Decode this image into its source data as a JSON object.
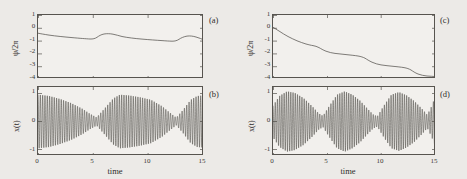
{
  "figure": {
    "background_color": "#eceae7",
    "frame_color": "#57544f",
    "curve_color": "#4a4744"
  },
  "panels": [
    {
      "id": "a",
      "tag": "(a)",
      "ylabel": "ψ/2π",
      "xlabel": "",
      "yticks": [
        "1",
        "0",
        "-1",
        "-2",
        "-3",
        "-4"
      ],
      "xticks": [
        "",
        "",
        "",
        ""
      ],
      "ylim": [
        -4,
        1
      ],
      "xlim": [
        0,
        15
      ]
    },
    {
      "id": "b",
      "tag": "(b)",
      "ylabel": "x(t)",
      "xlabel": "time",
      "yticks": [
        "1",
        "0",
        "-1"
      ],
      "xticks": [
        "0",
        "5",
        "10",
        "15"
      ],
      "ylim": [
        -1.35,
        1.35
      ],
      "xlim": [
        0,
        15
      ]
    },
    {
      "id": "c",
      "tag": "(c)",
      "ylabel": "ψ/2π",
      "xlabel": "",
      "yticks": [
        "1",
        "0",
        "-1",
        "-2",
        "-3",
        "-4"
      ],
      "xticks": [
        "",
        "",
        "",
        ""
      ],
      "ylim": [
        -4,
        1
      ],
      "xlim": [
        0,
        15
      ]
    },
    {
      "id": "d",
      "tag": "(d)",
      "ylabel": "x(t)",
      "xlabel": "time",
      "yticks": [
        "1",
        "0",
        "-1"
      ],
      "xticks": [
        "0",
        "5",
        "10",
        "15"
      ],
      "ylim": [
        -1.35,
        1.35
      ],
      "xlim": [
        0,
        15
      ]
    }
  ],
  "chart_data": [
    {
      "type": "line",
      "panel": "a",
      "title": "(a)",
      "xlabel": "time",
      "ylabel": "ψ/2π",
      "xlim": [
        0,
        15
      ],
      "ylim": [
        -4,
        1
      ],
      "xticks": [
        0,
        5,
        10,
        15
      ],
      "yticks": [
        1,
        0,
        -1,
        -2,
        -3,
        -4
      ],
      "grid": false,
      "legend": "none",
      "series": [
        {
          "name": "phase",
          "x": [
            0,
            0.5,
            1.0,
            1.5,
            2.0,
            2.5,
            3.0,
            3.5,
            4.0,
            4.5,
            5.0,
            5.3,
            5.6,
            6.0,
            6.4,
            6.8,
            7.2,
            7.6,
            8.0,
            8.5,
            9.0,
            9.5,
            10.0,
            10.5,
            11.0,
            11.5,
            12.0,
            12.5,
            12.9,
            13.3,
            13.7,
            14.1,
            14.5,
            15.0
          ],
          "y": [
            -0.42,
            -0.45,
            -0.47,
            -0.49,
            -0.51,
            -0.53,
            -0.55,
            -0.57,
            -0.58,
            -0.59,
            -0.6,
            -0.58,
            -0.5,
            -0.44,
            -0.42,
            -0.44,
            -0.48,
            -0.52,
            -0.55,
            -0.57,
            -0.59,
            -0.6,
            -0.62,
            -0.63,
            -0.64,
            -0.65,
            -0.66,
            -0.64,
            -0.56,
            -0.48,
            -0.46,
            -0.49,
            -0.54,
            -0.6
          ]
        }
      ]
    },
    {
      "type": "line",
      "panel": "b",
      "title": "(b)",
      "xlabel": "time",
      "ylabel": "x(t)",
      "xlim": [
        0,
        15
      ],
      "ylim": [
        -1.35,
        1.35
      ],
      "xticks": [
        0,
        5,
        10,
        15
      ],
      "yticks": [
        1,
        0,
        -1
      ],
      "grid": false,
      "legend": "none",
      "description": "Amplitude-modulated (beating) oscillation, carrier period approx 0.21 time units, beat nodes near t=5.3 and t=12.5",
      "carrier_period": 0.21,
      "envelope": {
        "x": [
          0,
          1.0,
          2.0,
          3.0,
          4.0,
          4.7,
          5.3,
          6.0,
          6.8,
          7.4,
          8.2,
          9.2,
          10.2,
          11.2,
          11.9,
          12.5,
          13.1,
          13.8,
          14.4,
          15.0
        ],
        "amplitude": [
          1.05,
          1.0,
          0.88,
          0.72,
          0.5,
          0.3,
          0.16,
          0.5,
          0.9,
          1.05,
          1.02,
          0.95,
          0.85,
          0.6,
          0.35,
          0.15,
          0.45,
          0.85,
          1.0,
          1.02
        ]
      }
    },
    {
      "type": "line",
      "panel": "c",
      "title": "(c)",
      "xlabel": "time",
      "ylabel": "ψ/2π",
      "xlim": [
        0,
        15
      ],
      "ylim": [
        -4,
        1
      ],
      "xticks": [
        0,
        5,
        10,
        15
      ],
      "yticks": [
        1,
        0,
        -1,
        -2,
        -3,
        -4
      ],
      "grid": false,
      "legend": "none",
      "description": "Monotonically decreasing phase with staircase-like plateaus (phase slips)",
      "series": [
        {
          "name": "phase",
          "x": [
            0,
            0.4,
            0.8,
            1.2,
            1.7,
            2.2,
            2.7,
            3.2,
            3.6,
            4.0,
            4.4,
            4.8,
            5.2,
            5.7,
            6.3,
            6.9,
            7.5,
            8.1,
            8.6,
            9.0,
            9.4,
            9.8,
            10.3,
            10.9,
            11.5,
            12.1,
            12.7,
            13.2,
            13.6,
            14.0,
            14.4,
            14.8,
            15.0
          ],
          "y": [
            0.05,
            -0.18,
            -0.38,
            -0.55,
            -0.72,
            -0.88,
            -1.0,
            -1.1,
            -1.25,
            -1.42,
            -1.55,
            -1.62,
            -1.68,
            -1.74,
            -1.8,
            -1.86,
            -1.92,
            -2.0,
            -2.12,
            -2.3,
            -2.45,
            -2.55,
            -2.62,
            -2.68,
            -2.74,
            -2.8,
            -2.88,
            -3.0,
            -3.15,
            -3.3,
            -3.42,
            -3.5,
            -3.55
          ]
        }
      ]
    },
    {
      "type": "line",
      "panel": "d",
      "title": "(d)",
      "xlabel": "time",
      "ylabel": "x(t)",
      "xlim": [
        0,
        15
      ],
      "ylim": [
        -1.35,
        1.35
      ],
      "xticks": [
        0,
        5,
        10,
        15
      ],
      "yticks": [
        1,
        0,
        -1
      ],
      "grid": false,
      "legend": "none",
      "description": "Amplitude-modulated (beating) oscillation with three beat cycles, nodes near t=4.6, t=9.6 and t=14.2",
      "carrier_period": 0.205,
      "envelope": {
        "x": [
          0,
          0.6,
          1.3,
          2.0,
          2.8,
          3.6,
          4.2,
          4.6,
          5.2,
          5.9,
          6.6,
          7.3,
          8.0,
          8.7,
          9.2,
          9.6,
          10.2,
          10.9,
          11.6,
          12.3,
          13.0,
          13.7,
          14.2,
          14.6,
          15.0
        ],
        "amplitude": [
          0.62,
          1.0,
          1.18,
          1.12,
          0.92,
          0.6,
          0.32,
          0.22,
          0.62,
          1.05,
          1.18,
          1.05,
          0.82,
          0.5,
          0.28,
          0.2,
          0.62,
          1.05,
          1.15,
          1.02,
          0.8,
          0.5,
          0.26,
          0.6,
          1.05
        ]
      }
    }
  ]
}
